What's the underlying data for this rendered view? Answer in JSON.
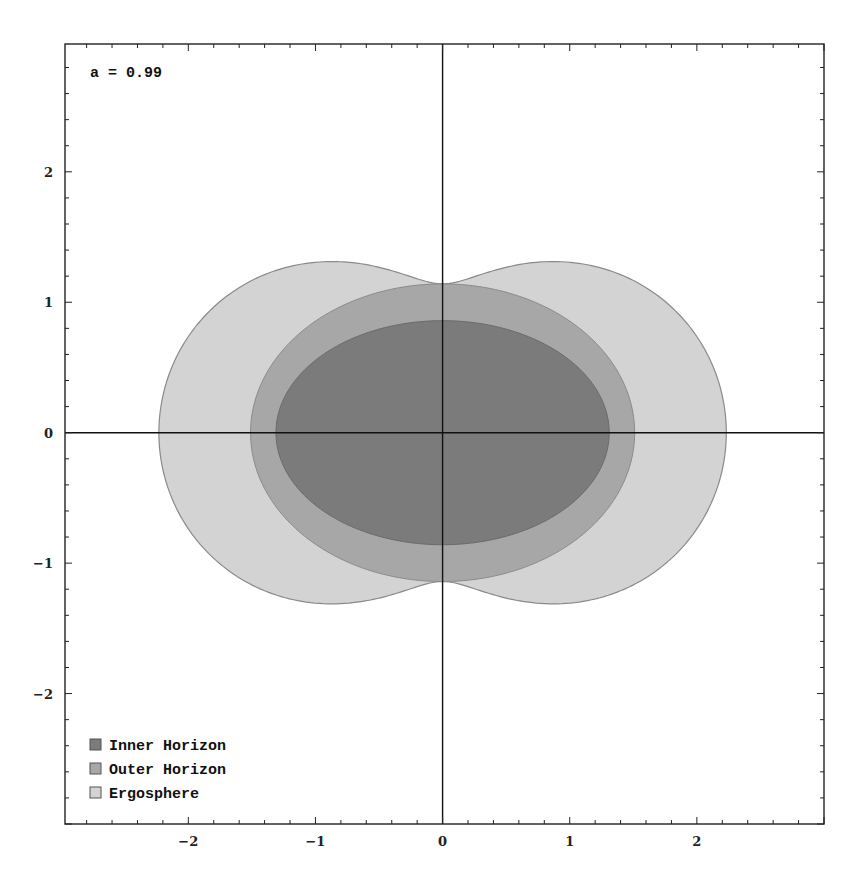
{
  "chart_data": {
    "type": "area",
    "title": "",
    "annotation": "a = 0.99",
    "spin_a": 0.99,
    "mass_M": 1,
    "xlabel": "",
    "ylabel": "",
    "xlim": [
      -2.97,
      3.0
    ],
    "ylim": [
      -3.0,
      2.98
    ],
    "x_ticks": [
      -2,
      -1,
      0,
      1,
      2
    ],
    "y_ticks": [
      -2,
      -1,
      0,
      1,
      2
    ],
    "x_tick_labels": [
      "-2",
      "-1",
      "0",
      "1",
      "2"
    ],
    "y_tick_labels": [
      "-2",
      "-1",
      "0",
      "1",
      "2"
    ],
    "minor_tick_step": 0.2,
    "grid": false,
    "axes_through_origin": true,
    "legend_position": "lower-left",
    "series": [
      {
        "name": "Ergosphere",
        "shape": "r_E(θ) = M + sqrt(M² − a² cos²θ); x = sqrt(r²+a²) sinθ, z = r cosθ",
        "equatorial_half_width": 2.23,
        "polar_half_height": 1.14,
        "max_height": 1.31,
        "color": "#d3d3d3"
      },
      {
        "name": "Outer Horizon",
        "shape": "r+ = M + sqrt(M² − a²) ellipse",
        "equatorial_half_width": 1.51,
        "polar_half_height": 1.14,
        "color": "#a7a7a7"
      },
      {
        "name": "Inner Horizon",
        "shape": "r- = M − sqrt(M² − a²) ellipse",
        "equatorial_half_width": 1.31,
        "polar_half_height": 0.86,
        "color": "#7b7b7b"
      }
    ]
  },
  "legend": {
    "items": [
      {
        "label": "Inner Horizon",
        "color": "#7b7b7b"
      },
      {
        "label": "Outer Horizon",
        "color": "#a7a7a7"
      },
      {
        "label": "Ergosphere",
        "color": "#d3d3d3"
      }
    ]
  }
}
